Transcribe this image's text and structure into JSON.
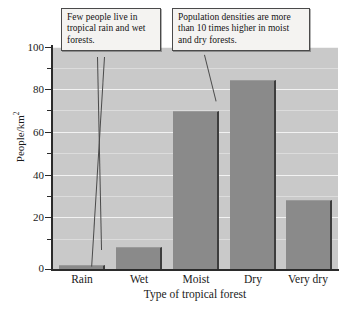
{
  "chart_data": {
    "type": "bar",
    "title": "",
    "categories": [
      "Rain",
      "Wet",
      "Moist",
      "Dry",
      "Very dry"
    ],
    "values": [
      2,
      10,
      71,
      85,
      31
    ],
    "xlabel": "Type of tropical forest",
    "ylabel": "People/km",
    "ylabel_exponent": "2",
    "ylim": [
      0,
      100
    ],
    "ytick_labels": [
      "0",
      "20",
      "40",
      "60",
      "80",
      "100"
    ],
    "ytick_values": [
      0,
      20,
      40,
      60,
      80,
      100
    ],
    "minor_tick_values": [
      10,
      30,
      50,
      70,
      90
    ],
    "grid": true,
    "legend": "none",
    "bar_color": "#8a8a8a",
    "plot_background": "#c9c9c9",
    "gridline_color": "#f2f2f2",
    "annotations": [
      {
        "id": "left",
        "text": "Few people live in tropical rain and wet forests.",
        "points_to": [
          "Rain",
          "Wet"
        ]
      },
      {
        "id": "right",
        "text": "Population densities are more than 10 times higher in moist and dry forests.",
        "points_to": [
          "Moist",
          "Dry"
        ]
      }
    ]
  }
}
